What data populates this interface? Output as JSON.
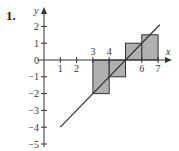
{
  "problem": {
    "number": "1."
  },
  "chart_data": {
    "type": "line",
    "title": "",
    "xlabel": "x",
    "ylabel": "y",
    "xlim": [
      0,
      7.6
    ],
    "ylim": [
      -5.2,
      3
    ],
    "grid": false,
    "x_tick_labels": [
      "1",
      "2",
      "3",
      "4",
      "6",
      "7"
    ],
    "x_ticks": [
      1,
      2,
      3,
      4,
      6,
      7
    ],
    "y_tick_labels": [
      "2",
      "1",
      "0",
      "-1",
      "-2",
      "-3",
      "-4",
      "-5"
    ],
    "y_ticks": [
      2,
      1,
      0,
      -1,
      -2,
      -3,
      -4,
      -5
    ],
    "series": [
      {
        "name": "line y = x - 5",
        "x": [
          1,
          7.1
        ],
        "y": [
          -4,
          2.1
        ]
      }
    ],
    "rectangles": [
      {
        "x0": 3,
        "x1": 4,
        "height": -2
      },
      {
        "x0": 4,
        "x1": 5,
        "height": -1
      },
      {
        "x0": 5,
        "x1": 6,
        "height": 1
      },
      {
        "x0": 6,
        "x1": 7,
        "height": 1.5
      }
    ],
    "colors": {
      "rect_fill": "#b0b0b0",
      "stroke": "#333333",
      "background": "#ffffff"
    }
  }
}
